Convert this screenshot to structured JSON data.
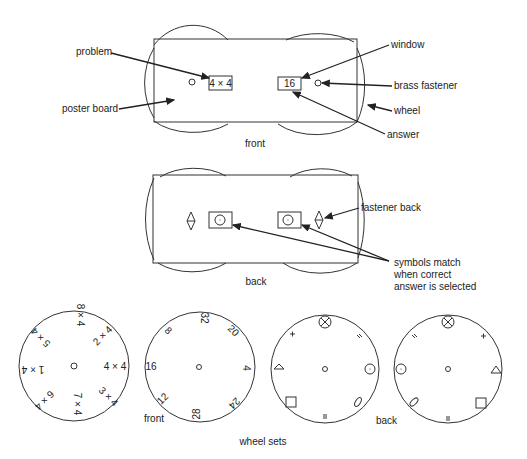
{
  "front": {
    "caption": "front",
    "problem_window": "4 × 4",
    "answer_window": "16",
    "labels": {
      "problem": "problem",
      "poster_board": "poster board",
      "window": "window",
      "brass_fastener": "brass fastener",
      "wheel": "wheel",
      "answer": "answer"
    }
  },
  "back": {
    "caption": "back",
    "labels": {
      "fastener_back": "fastener back",
      "symbols_line1": "symbols match",
      "symbols_line2": "when correct",
      "symbols_line3": "answer is selected"
    }
  },
  "wheel_sets": {
    "caption": "wheel sets",
    "front_caption": "front",
    "back_caption": "back",
    "problem_wheel": [
      "8 × 4",
      "2 × 4",
      "4 × 4",
      "3 × 4",
      "7 × 4",
      "6 × 4",
      "1 × 4",
      "5 × 4"
    ],
    "answer_wheel": [
      "32",
      "20",
      "4",
      "24",
      "28",
      "12",
      "16",
      "8"
    ]
  }
}
